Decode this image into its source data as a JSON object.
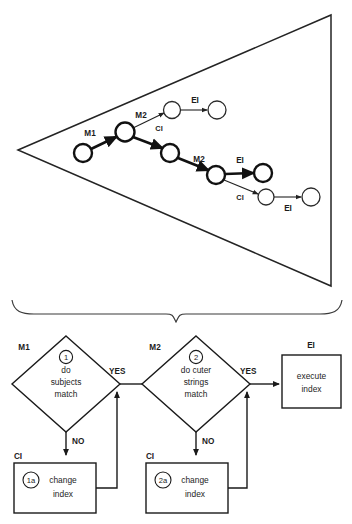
{
  "figure": {
    "top_panel": {
      "name": "search-tree-triangle",
      "shape": "triangle",
      "nodes": [
        {
          "id": "n0",
          "cx": 83,
          "cy": 153,
          "r": 9,
          "weight": "bold"
        },
        {
          "id": "n1",
          "cx": 125,
          "cy": 132,
          "r": 9.5,
          "weight": "bold"
        },
        {
          "id": "n2",
          "cx": 172,
          "cy": 110,
          "r": 8.5,
          "weight": "thin"
        },
        {
          "id": "n3",
          "cx": 217,
          "cy": 110,
          "r": 9,
          "weight": "thin"
        },
        {
          "id": "n4",
          "cx": 170,
          "cy": 153,
          "r": 9,
          "weight": "bold"
        },
        {
          "id": "n5",
          "cx": 216,
          "cy": 175,
          "r": 9,
          "weight": "bold"
        },
        {
          "id": "n6",
          "cx": 263,
          "cy": 173,
          "r": 9,
          "weight": "bold"
        },
        {
          "id": "n7",
          "cx": 266,
          "cy": 197,
          "r": 8,
          "weight": "thin"
        },
        {
          "id": "n8",
          "cx": 311,
          "cy": 197,
          "r": 9,
          "weight": "thin"
        }
      ],
      "edges": [
        {
          "from": "n0",
          "to": "n1",
          "label": "M1",
          "weight": "thick"
        },
        {
          "from": "n1",
          "to": "n2",
          "label": "M2",
          "weight": "thin"
        },
        {
          "from": "n2",
          "to": "n3",
          "label": "EI",
          "weight": "thin"
        },
        {
          "from": "n1",
          "to": "n4",
          "label": "CI",
          "weight": "thick"
        },
        {
          "from": "n4",
          "to": "n5",
          "label": "M2",
          "weight": "thick"
        },
        {
          "from": "n5",
          "to": "n6",
          "label": "EI",
          "weight": "thick"
        },
        {
          "from": "n5",
          "to": "n7",
          "label": "CI",
          "weight": "thin"
        },
        {
          "from": "n7",
          "to": "n8",
          "label": "EI",
          "weight": "thin"
        }
      ],
      "edge_labels": {
        "m1": "M1",
        "m2_upper": "M2",
        "ci_upper": "CI",
        "ei_upper": "EI",
        "m2_lower": "M2",
        "ei_mid": "EI",
        "ci_lower": "CI",
        "ei_lower": "EI"
      }
    },
    "brace": {
      "name": "curly-brace",
      "orientation": "down"
    },
    "bottom_panel": {
      "name": "decision-flowchart",
      "steps": [
        {
          "kind": "decision",
          "outer_label": "M1",
          "number": "1",
          "lines": [
            "do",
            "subjects",
            "match"
          ],
          "yes_label": "YES",
          "no_label": "NO"
        },
        {
          "kind": "decision",
          "outer_label": "M2",
          "number": "2",
          "lines": [
            "do cuter",
            "strings",
            "match"
          ],
          "yes_label": "YES",
          "no_label": "NO"
        },
        {
          "kind": "process",
          "outer_label": "EI",
          "number": "",
          "lines": [
            "execute",
            "index"
          ]
        }
      ],
      "fallbacks": [
        {
          "kind": "process",
          "outer_label": "CI",
          "number": "1a",
          "lines": [
            "change",
            "index"
          ]
        },
        {
          "kind": "process",
          "outer_label": "CI",
          "number": "2a",
          "lines": [
            "change",
            "index"
          ]
        }
      ]
    },
    "colors": {
      "ink": "#1a1a1a",
      "paper": "#ffffff",
      "brace": "#3a3a3a"
    }
  }
}
